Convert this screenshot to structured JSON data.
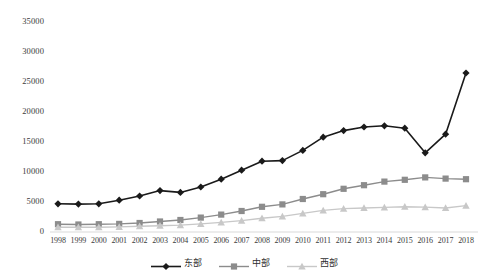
{
  "chart_data": {
    "type": "line",
    "title": "",
    "xlabel": "",
    "ylabel": "",
    "grid": false,
    "legend_position": "bottom",
    "ylim": [
      0,
      35000
    ],
    "ytick_labels": [
      "0",
      "5000",
      "10000",
      "15000",
      "20000",
      "25000",
      "30000",
      "35000"
    ],
    "ytick_values": [
      0,
      5000,
      10000,
      15000,
      20000,
      25000,
      30000,
      35000
    ],
    "categories": [
      "1998",
      "1999",
      "2000",
      "2001",
      "2002",
      "2003",
      "2004",
      "2005",
      "2006",
      "2007",
      "2008",
      "2009",
      "2010",
      "2011",
      "2012",
      "2013",
      "2014",
      "2015",
      "2016",
      "2017",
      "2018"
    ],
    "series": [
      {
        "name": "东部",
        "color": "#1a1a1a",
        "marker": "diamond",
        "values": [
          4700,
          4650,
          4700,
          5300,
          6000,
          6900,
          6600,
          7500,
          8800,
          10300,
          11800,
          11900,
          13600,
          15800,
          16900,
          17500,
          17700,
          17300,
          13200,
          16300,
          26500
        ]
      },
      {
        "name": "中部",
        "color": "#8c8c8c",
        "marker": "square",
        "values": [
          1300,
          1250,
          1300,
          1350,
          1500,
          1750,
          2000,
          2400,
          2900,
          3500,
          4200,
          4600,
          5500,
          6300,
          7200,
          7800,
          8400,
          8700,
          9100,
          8900,
          8800
        ]
      },
      {
        "name": "西部",
        "color": "#c8c8c8",
        "marker": "triangle",
        "values": [
          800,
          780,
          800,
          850,
          950,
          1050,
          1150,
          1350,
          1600,
          1900,
          2300,
          2600,
          3100,
          3600,
          3900,
          4000,
          4100,
          4200,
          4150,
          4000,
          4400
        ]
      }
    ]
  },
  "legend": {
    "items": [
      {
        "label": "东部"
      },
      {
        "label": "中部"
      },
      {
        "label": "西部"
      }
    ]
  }
}
